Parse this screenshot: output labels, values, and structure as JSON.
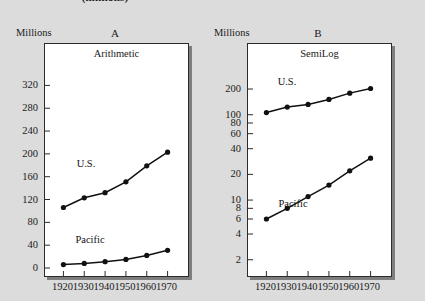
{
  "figure": {
    "suptitle": "(millions)",
    "background_color": "#dcdcdc",
    "axis_caption": "Millions"
  },
  "panels": [
    {
      "letter": "A",
      "scale_label": "Arithmetic",
      "axis_caption": "Millions",
      "y_ticks": [
        "0",
        "40",
        "80",
        "120",
        "160",
        "200",
        "240",
        "280",
        "320"
      ],
      "x_ticks": [
        "1920",
        "1930",
        "1940",
        "1950",
        "1960",
        "1970"
      ],
      "series_labels": [
        "U.S.",
        "Pacific"
      ]
    },
    {
      "letter": "B",
      "scale_label": "SemiLog",
      "axis_caption": "Millions",
      "y_ticks": [
        "2",
        "4",
        "6",
        "8",
        "10",
        "20",
        "40",
        "60",
        "80",
        "100",
        "200"
      ],
      "x_ticks": [
        "1920",
        "1930",
        "1940",
        "1950",
        "1960",
        "1970"
      ],
      "series_labels": [
        "U.S.",
        "Pacific"
      ]
    }
  ],
  "chart_data": [
    {
      "type": "line",
      "title": "A",
      "subtitle": "Arithmetic",
      "xlabel": "",
      "ylabel": "Millions",
      "yscale": "linear",
      "ylim": [
        0,
        340
      ],
      "xlim": [
        1915,
        1975
      ],
      "grid": false,
      "markers": true,
      "legend": "inline",
      "x": [
        1920,
        1930,
        1940,
        1950,
        1960,
        1970
      ],
      "yticks": [
        0,
        40,
        80,
        120,
        160,
        200,
        240,
        280,
        320
      ],
      "series": [
        {
          "name": "U.S.",
          "values": [
            106,
            123,
            132,
            151,
            179,
            203
          ]
        },
        {
          "name": "Pacific",
          "values": [
            6,
            8,
            11,
            15,
            22,
            31
          ]
        }
      ]
    },
    {
      "type": "line",
      "title": "B",
      "subtitle": "SemiLog",
      "xlabel": "",
      "ylabel": "Millions",
      "yscale": "log",
      "ylim": [
        1.6,
        300
      ],
      "xlim": [
        1915,
        1975
      ],
      "grid": false,
      "markers": true,
      "legend": "inline",
      "x": [
        1920,
        1930,
        1940,
        1950,
        1960,
        1970
      ],
      "yticks": [
        2,
        4,
        6,
        8,
        10,
        20,
        40,
        60,
        80,
        100,
        200
      ],
      "series": [
        {
          "name": "U.S.",
          "values": [
            106,
            123,
            132,
            151,
            179,
            203
          ]
        },
        {
          "name": "Pacific",
          "values": [
            6,
            8,
            11,
            15,
            22,
            31
          ]
        }
      ]
    }
  ]
}
